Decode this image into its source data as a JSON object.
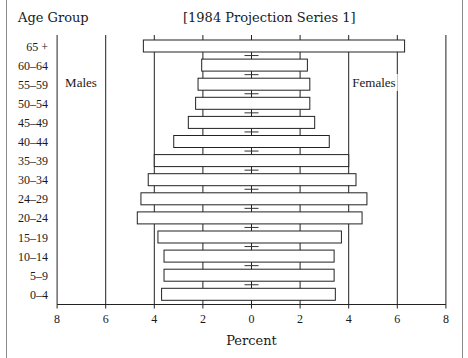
{
  "chart_data": {
    "type": "bar",
    "subtype": "population-pyramid",
    "title": "[1984 Projection Series 1]",
    "ylabel": "Age Group",
    "xlabel": "Percent",
    "categories": [
      "65 +",
      "60–64",
      "55–59",
      "50–54",
      "45–49",
      "40–44",
      "35–39",
      "30–34",
      "24–29",
      "20–24",
      "15–19",
      "10–14",
      "5–9",
      "0–4"
    ],
    "series": [
      {
        "name": "Males",
        "side": "left",
        "values": [
          4.45,
          2.05,
          2.2,
          2.3,
          2.6,
          3.2,
          4.0,
          4.25,
          4.55,
          4.7,
          3.85,
          3.6,
          3.6,
          3.7
        ]
      },
      {
        "name": "Females",
        "side": "right",
        "values": [
          6.3,
          2.3,
          2.4,
          2.4,
          2.6,
          3.2,
          4.0,
          4.3,
          4.75,
          4.55,
          3.7,
          3.4,
          3.4,
          3.45
        ]
      }
    ],
    "x_ticks": [
      "8",
      "6",
      "4",
      "2",
      "0",
      "2",
      "4",
      "6",
      "8"
    ],
    "xlim": [
      -8,
      8
    ],
    "grid": "vertical lines at 2, 4, 6",
    "legend": {
      "left_label": "Males",
      "right_label": "Females"
    }
  },
  "header": {
    "age_group_label": "Age Group",
    "subtitle": "[1984 Projection Series 1]"
  },
  "axis": {
    "xlabel": "Percent"
  }
}
